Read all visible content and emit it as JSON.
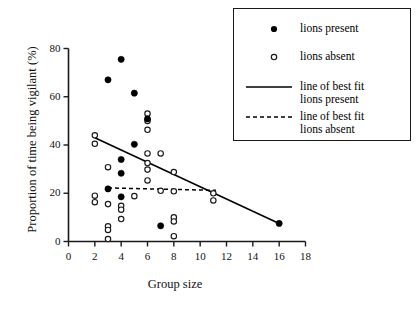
{
  "chart_data": {
    "type": "scatter",
    "title": "",
    "xlabel": "Group size",
    "ylabel": "Proportion of time being vigilant (%)",
    "xlim": [
      0,
      18
    ],
    "ylim": [
      0,
      80
    ],
    "xticks": [
      0,
      2,
      4,
      6,
      8,
      10,
      12,
      14,
      16,
      18
    ],
    "yticks": [
      0,
      20,
      40,
      60,
      80
    ],
    "grid": false,
    "legend_position": "top-right",
    "series": [
      {
        "name": "lions present",
        "marker": "filled-circle",
        "points": [
          [
            3,
            67.0
          ],
          [
            4,
            75.5
          ],
          [
            5,
            61.5
          ],
          [
            6,
            50.8
          ],
          [
            5,
            40.3
          ],
          [
            4,
            34.0
          ],
          [
            4,
            28.3
          ],
          [
            3,
            21.8
          ],
          [
            4,
            18.5
          ],
          [
            7,
            6.5
          ],
          [
            16,
            7.5
          ]
        ]
      },
      {
        "name": "lions absent",
        "marker": "open-circle",
        "points": [
          [
            6,
            53.0
          ],
          [
            6,
            50.0
          ],
          [
            6,
            46.3
          ],
          [
            2,
            44.0
          ],
          [
            2,
            40.5
          ],
          [
            6,
            36.5
          ],
          [
            7,
            36.5
          ],
          [
            6,
            32.5
          ],
          [
            3,
            30.8
          ],
          [
            6,
            29.8
          ],
          [
            8,
            28.8
          ],
          [
            6,
            25.3
          ],
          [
            2,
            19.0
          ],
          [
            5,
            18.8
          ],
          [
            7,
            21.0
          ],
          [
            8,
            20.8
          ],
          [
            11,
            20.0
          ],
          [
            2,
            16.3
          ],
          [
            3,
            15.5
          ],
          [
            11,
            17.0
          ],
          [
            4,
            14.8
          ],
          [
            4,
            13.2
          ],
          [
            4,
            9.3
          ],
          [
            8,
            10.0
          ],
          [
            8,
            8.3
          ],
          [
            3,
            6.3
          ],
          [
            3,
            4.8
          ],
          [
            8,
            2.2
          ],
          [
            3,
            1.0
          ]
        ]
      }
    ],
    "lines": [
      {
        "name": "line of best fit lions present",
        "style": "solid",
        "x_start": 2.0,
        "y_start": 43.0,
        "x_end": 16.0,
        "y_end": 7.5
      },
      {
        "name": "line of best fit lions absent",
        "style": "dashed",
        "x_start": 3.0,
        "y_start": 22.2,
        "x_end": 11.2,
        "y_end": 21.2
      }
    ]
  },
  "axes": {
    "x_title": "Group size",
    "y_title": "Proportion of time being vigilant (%)",
    "x_tick_labels": [
      "0",
      "2",
      "4",
      "6",
      "8",
      "10",
      "12",
      "14",
      "16",
      "18"
    ],
    "y_tick_labels": [
      "0",
      "20",
      "40",
      "60",
      "80"
    ]
  },
  "legend": {
    "entries": [
      {
        "symbol": "filled-circle",
        "label": "lions present",
        "label2": ""
      },
      {
        "symbol": "open-circle",
        "label": "lions absent",
        "label2": ""
      },
      {
        "symbol": "solid-line",
        "label": "line of best fit",
        "label2": "lions present"
      },
      {
        "symbol": "dashed-line",
        "label": "line of best fit",
        "label2": "lions absent"
      }
    ]
  },
  "colors": {
    "axis": "#1a1a1a",
    "marker_present": "#000000",
    "marker_absent_stroke": "#1a1a1a",
    "line": "#000000",
    "background": "#ffffff"
  }
}
